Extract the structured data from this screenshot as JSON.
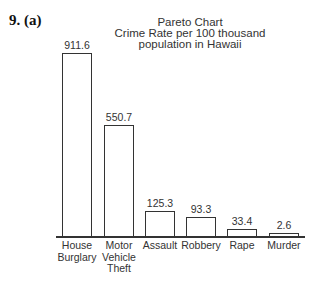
{
  "question_label": "9. (a)",
  "chart_data": {
    "type": "bar",
    "title": "Pareto Chart",
    "subtitle_lines": [
      "Crime Rate per 100 thousand",
      "population in Hawaii"
    ],
    "categories": [
      "House Burglary",
      "Motor Vehicle Theft",
      "Assault",
      "Robbery",
      "Rape",
      "Murder"
    ],
    "category_lines": [
      [
        "House",
        "Burglary"
      ],
      [
        "Motor",
        "Vehicle",
        "Theft"
      ],
      [
        "Assault"
      ],
      [
        "Robbery"
      ],
      [
        "Rape"
      ],
      [
        "Murder"
      ]
    ],
    "values": [
      911.6,
      550.7,
      125.3,
      93.3,
      33.4,
      2.6
    ],
    "value_labels": [
      "911.6",
      "550.7",
      "125.3",
      "93.3",
      "33.4",
      "2.6"
    ],
    "xlabel": "",
    "ylabel": "",
    "ylim": [
      0,
      911.6
    ],
    "grid": false,
    "legend": null,
    "sorted_descending": true
  }
}
